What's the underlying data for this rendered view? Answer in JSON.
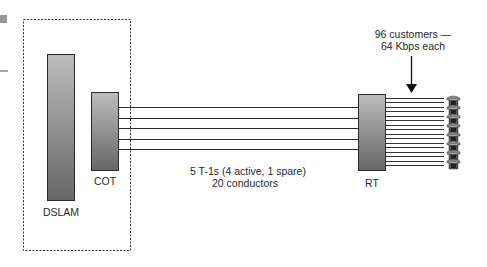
{
  "diagram": {
    "components": {
      "dslam": {
        "label": "DSLAM"
      },
      "cot": {
        "label": "COT"
      },
      "rt": {
        "label": "RT"
      }
    },
    "trunk": {
      "line1": "5 T-1s (4 active, 1 spare)",
      "line2": "20 conductors",
      "count": 5
    },
    "customers": {
      "line1": "96 customers —",
      "line2": "64 Kbps each",
      "phone_icon_count": 8,
      "drop_line_count": 16
    },
    "icons": {
      "phone": "telephone-icon",
      "arrow": "arrow-down-icon"
    },
    "colors": {
      "box_top": "#b8b8b8",
      "box_bottom": "#6a6a6a",
      "stroke": "#2a2a2a"
    }
  }
}
